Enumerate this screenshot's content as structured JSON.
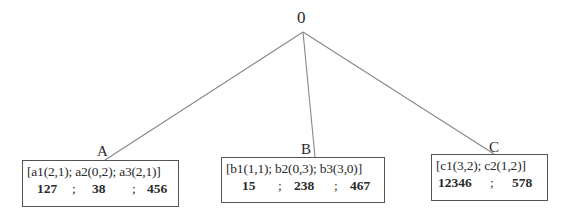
{
  "tree": {
    "root": {
      "label": "0"
    },
    "children": [
      {
        "label": "A",
        "moves": "[a1(2,1); a2(0,2); a3(2,1)]",
        "values": [
          "127",
          ";",
          "38",
          ";",
          "456"
        ]
      },
      {
        "label": "B",
        "moves": "[b1(1,1); b2(0,3); b3(3,0)]",
        "values": [
          "15",
          ";",
          "238",
          ";",
          "467"
        ]
      },
      {
        "label": "C",
        "moves": "[c1(3,2); c2(1,2)]",
        "values": [
          "12346",
          ";",
          "578"
        ]
      }
    ]
  },
  "colors": {
    "line": "#888888",
    "text": "#2a2a2a",
    "border": "#555555"
  }
}
